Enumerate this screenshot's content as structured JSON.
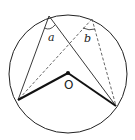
{
  "diagram": {
    "type": "circle-inscribed-angles",
    "circle": {
      "cx": 68,
      "cy": 74,
      "r": 59
    },
    "points": {
      "A": {
        "x": 49,
        "y": 16
      },
      "B": {
        "x": 92,
        "y": 19
      },
      "P": {
        "x": 18,
        "y": 100
      },
      "Q": {
        "x": 116,
        "y": 106
      },
      "O": {
        "x": 68,
        "y": 73
      }
    },
    "labels": {
      "angle_a": "a",
      "angle_b": "b",
      "center": "O"
    },
    "colors": {
      "stroke": "#222222",
      "dashed": "#555555",
      "background": "#ffffff"
    }
  }
}
